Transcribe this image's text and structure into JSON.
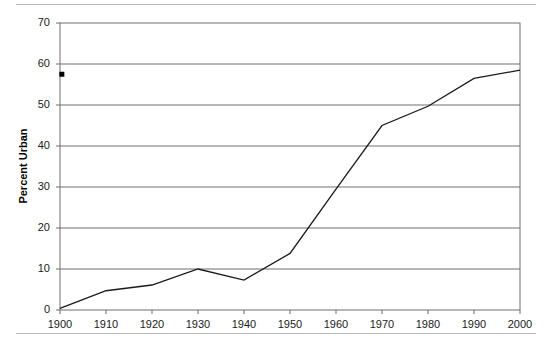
{
  "chart_data": {
    "type": "line",
    "title": "",
    "xlabel": "",
    "ylabel": "Percent Urban",
    "x": [
      1900,
      1910,
      1920,
      1930,
      1940,
      1950,
      1960,
      1970,
      1980,
      1990,
      2000
    ],
    "values": [
      0.4,
      4.7,
      6.1,
      10.0,
      7.3,
      13.8,
      29.5,
      45.0,
      49.7,
      56.5,
      58.5
    ],
    "series": [
      {
        "name": "Percent Urban",
        "values": [
          0.4,
          4.7,
          6.1,
          10.0,
          7.3,
          13.8,
          29.5,
          45.0,
          49.7,
          56.5,
          58.5
        ],
        "color": "#1a1a1a"
      }
    ],
    "xlim": [
      1900,
      2000
    ],
    "ylim": [
      0,
      70
    ],
    "xticks": [
      "1900",
      "1910",
      "1920",
      "1930",
      "1940",
      "1950",
      "1960",
      "1970",
      "1980",
      "1990",
      "2000"
    ],
    "yticks": [
      "0",
      "10",
      "20",
      "30",
      "40",
      "50",
      "60",
      "70"
    ],
    "ytick_values": [
      0,
      10,
      20,
      30,
      40,
      50,
      60,
      70
    ],
    "grid": "horizontal",
    "legend": "none",
    "markers": [
      {
        "name": "stray-square-marker",
        "x": 1900.4,
        "y": 57.5,
        "color": "#000000"
      }
    ],
    "line_color": "#1a1a1a",
    "grid_color": "#6e6e6e",
    "axis_color": "#6e6e6e",
    "background_color": "#ffffff"
  },
  "axis_titles": {
    "y": "Percent Urban"
  }
}
